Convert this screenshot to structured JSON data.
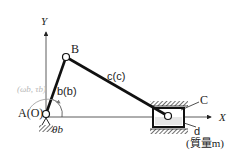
{
  "diagram": {
    "type": "slider-crank mechanism",
    "axes": {
      "x_label": "X",
      "y_label": "Y"
    },
    "joints": {
      "A": {
        "label": "A(O)"
      },
      "B": {
        "label": "B"
      },
      "C": {
        "label": "C"
      }
    },
    "links": {
      "b": {
        "label": "b(b)",
        "name": "b",
        "length": "b"
      },
      "c": {
        "label": "c(c)",
        "name": "c",
        "length": "c"
      },
      "d": {
        "label": "d",
        "mass_label": "(質量m)"
      }
    },
    "angle_label": "θb",
    "input_label": "(ωb, τb)",
    "colors": {
      "line": "#1a1a1a",
      "slider_fill": "#e6e6e6",
      "faint_text": "#b8b8b8"
    }
  }
}
